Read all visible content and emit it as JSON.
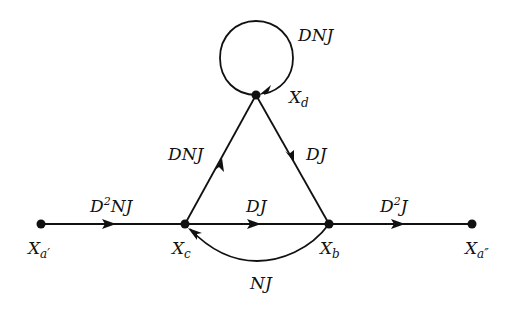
{
  "diagram": {
    "type": "signal-flow-graph",
    "nodes": [
      {
        "id": "xa1",
        "label": "X",
        "sub": "a′",
        "x": 41,
        "y": 224
      },
      {
        "id": "xc",
        "label": "X",
        "sub": "c",
        "x": 185,
        "y": 224
      },
      {
        "id": "xb",
        "label": "X",
        "sub": "b",
        "x": 329,
        "y": 224
      },
      {
        "id": "xa2",
        "label": "X",
        "sub": "a″",
        "x": 472,
        "y": 224
      },
      {
        "id": "xd",
        "label": "X",
        "sub": "d",
        "x": 256,
        "y": 95
      }
    ],
    "edges": [
      {
        "id": "e1",
        "from": "xa1",
        "to": "xc",
        "gain": "D²NJ",
        "gain_base": "D",
        "gain_sup": "2",
        "gain_rest": "NJ"
      },
      {
        "id": "e2",
        "from": "xc",
        "to": "xb",
        "gain": "DJ"
      },
      {
        "id": "e3",
        "from": "xb",
        "to": "xa2",
        "gain": "D²J",
        "gain_base": "D",
        "gain_sup": "2",
        "gain_rest": "J"
      },
      {
        "id": "e4",
        "from": "xc",
        "to": "xd",
        "gain": "DNJ"
      },
      {
        "id": "e5",
        "from": "xd",
        "to": "xb",
        "gain": "DJ"
      },
      {
        "id": "e6",
        "from": "xb",
        "to": "xc",
        "gain": "NJ"
      },
      {
        "id": "e7",
        "from": "xd",
        "to": "xd",
        "gain": "DNJ",
        "self_loop": true
      }
    ]
  },
  "labels": {
    "xa1": {
      "main": "X",
      "sub": "a′"
    },
    "xc": {
      "main": "X",
      "sub": "c"
    },
    "xb": {
      "main": "X",
      "sub": "b"
    },
    "xa2": {
      "main": "X",
      "sub": "a″"
    },
    "xd": {
      "main": "X",
      "sub": "d"
    },
    "e1": {
      "base": "D",
      "sup": "2",
      "rest": "NJ"
    },
    "e2": "DJ",
    "e3": {
      "base": "D",
      "sup": "2",
      "rest": "J"
    },
    "e4": "DNJ",
    "e5": "DJ",
    "e6": "NJ",
    "e7": "DNJ"
  }
}
